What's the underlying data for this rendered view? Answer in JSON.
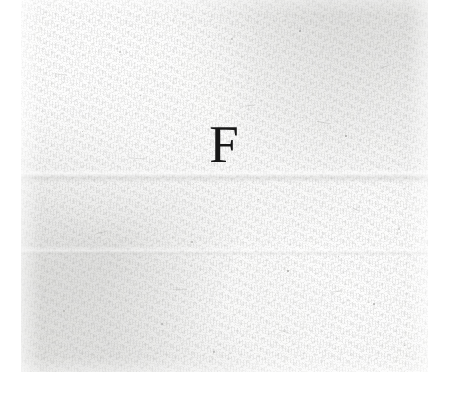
{
  "document": {
    "type": "scanned-paper-fragment",
    "glyph": "F",
    "glyph_description": "serif capital letter F in black ink",
    "paper_tone_hex": "#ededec",
    "ink_color_hex": "#171717",
    "canvas_background_hex": "#ffffff",
    "paper_region": {
      "left": 21,
      "top": 0,
      "width": 407,
      "height": 372
    },
    "glyph_box": {
      "left": 212,
      "top": 143,
      "width": 25,
      "height": 37
    },
    "specks": [
      {
        "x": 119,
        "y": 51,
        "d": 2.2
      },
      {
        "x": 231,
        "y": 38,
        "d": 1.8
      },
      {
        "x": 299,
        "y": 30,
        "d": 1.5
      },
      {
        "x": 345,
        "y": 135,
        "d": 1.7
      },
      {
        "x": 302,
        "y": 117,
        "d": 1.4
      },
      {
        "x": 398,
        "y": 228,
        "d": 1.9
      },
      {
        "x": 191,
        "y": 241,
        "d": 1.6
      },
      {
        "x": 287,
        "y": 270,
        "d": 1.5
      },
      {
        "x": 97,
        "y": 185,
        "d": 1.4
      },
      {
        "x": 63,
        "y": 310,
        "d": 1.8
      },
      {
        "x": 161,
        "y": 323,
        "d": 1.5
      },
      {
        "x": 373,
        "y": 303,
        "d": 1.6
      },
      {
        "x": 404,
        "y": 345,
        "d": 1.4
      },
      {
        "x": 140,
        "y": 95,
        "d": 1.3
      },
      {
        "x": 258,
        "y": 199,
        "d": 1.3
      },
      {
        "x": 338,
        "y": 256,
        "d": 1.4
      },
      {
        "x": 82,
        "y": 131,
        "d": 1.3
      },
      {
        "x": 213,
        "y": 351,
        "d": 1.5
      },
      {
        "x": 35,
        "y": 217,
        "d": 1.4
      },
      {
        "x": 419,
        "y": 163,
        "d": 1.3
      }
    ],
    "flecks": [
      {
        "x": 246,
        "y": 105,
        "w": 9,
        "h": 1.0,
        "rot": -6,
        "op": 0.3
      },
      {
        "x": 317,
        "y": 122,
        "w": 13,
        "h": 1.0,
        "rot": 11,
        "op": 0.26
      },
      {
        "x": 96,
        "y": 232,
        "w": 11,
        "h": 1.0,
        "rot": -14,
        "op": 0.24
      },
      {
        "x": 352,
        "y": 209,
        "w": 8,
        "h": 1.0,
        "rot": 26,
        "op": 0.28
      },
      {
        "x": 173,
        "y": 289,
        "w": 14,
        "h": 1.0,
        "rot": -3,
        "op": 0.22
      },
      {
        "x": 279,
        "y": 331,
        "w": 10,
        "h": 1.0,
        "rot": 18,
        "op": 0.24
      },
      {
        "x": 55,
        "y": 74,
        "w": 12,
        "h": 1.0,
        "rot": 8,
        "op": 0.22
      },
      {
        "x": 381,
        "y": 66,
        "w": 9,
        "h": 1.0,
        "rot": -21,
        "op": 0.26
      },
      {
        "x": 129,
        "y": 158,
        "w": 15,
        "h": 1.0,
        "rot": 4,
        "op": 0.2
      },
      {
        "x": 330,
        "y": 291,
        "w": 11,
        "h": 1.0,
        "rot": -9,
        "op": 0.22
      }
    ]
  }
}
